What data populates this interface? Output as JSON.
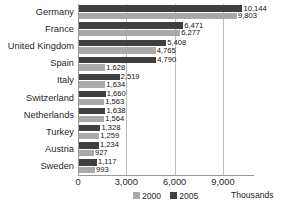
{
  "chart_data": {
    "type": "bar",
    "orientation": "horizontal",
    "title": "",
    "xlabel": "Thousands",
    "ylabel": "",
    "categories": [
      "Germany",
      "France",
      "United Kingdom",
      "Spain",
      "Italy",
      "Switzerland",
      "Netherlands",
      "Turkey",
      "Austria",
      "Sweden"
    ],
    "series": [
      {
        "name": "2005",
        "color": "#3f3f3f",
        "values": [
          10144,
          6471,
          5408,
          4790,
          2519,
          1660,
          1638,
          1328,
          1234,
          1117
        ],
        "labels": [
          "10,144",
          "6,471",
          "5,408",
          "4,790",
          "2,519",
          "1,660",
          "1,638",
          "1,328",
          "1,234",
          "1,117"
        ]
      },
      {
        "name": "2000",
        "color": "#a9a9a9",
        "values": [
          9803,
          6277,
          4765,
          1628,
          1634,
          1563,
          1564,
          1259,
          927,
          993
        ],
        "labels": [
          "9,803",
          "6,277",
          "4,765",
          "1,628",
          "1,634",
          "1,563",
          "1,564",
          "1,259",
          "927",
          "993"
        ]
      }
    ],
    "xticks": [
      0,
      3000,
      6000,
      9000
    ],
    "xtick_labels": [
      "0",
      "3,000",
      "6,000",
      "9,000"
    ],
    "xlim": [
      0,
      10900
    ],
    "grid": true,
    "legend_position": "bottom",
    "legend": [
      {
        "label": "2000",
        "color": "#a9a9a9"
      },
      {
        "label": "2005",
        "color": "#3f3f3f"
      }
    ]
  }
}
